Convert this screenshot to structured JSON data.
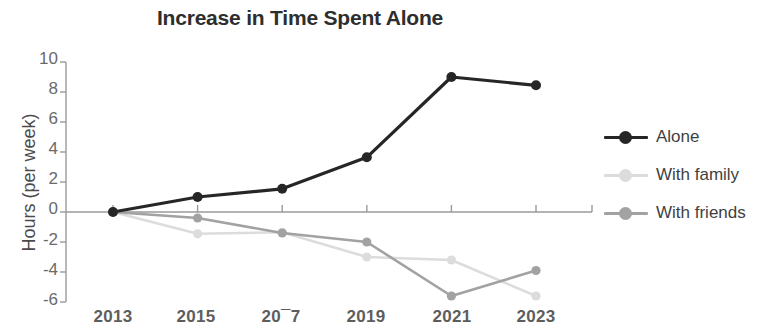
{
  "chart_data": {
    "type": "line",
    "title": "Increase in Time Spent Alone",
    "xlabel": "",
    "ylabel": "Hours (per week)",
    "categories": [
      "2013",
      "2015",
      "2017",
      "2019",
      "2021",
      "2023"
    ],
    "x_tick_labels_rendered": [
      "2013",
      "2015",
      "20¯7",
      "2019",
      "2021",
      "2023"
    ],
    "y_tick_labels": [
      "10",
      "8",
      "6",
      "4",
      "2",
      "0",
      "-2",
      "-4",
      "-6"
    ],
    "y_ticks": [
      10,
      8,
      6,
      4,
      2,
      0,
      -2,
      -4,
      -6
    ],
    "ylim": [
      -6,
      10
    ],
    "grid": false,
    "legend_position": "right",
    "series": [
      {
        "name": "Alone",
        "color": "#262626",
        "values": [
          0.0,
          1.0,
          1.55,
          3.65,
          9.0,
          8.45
        ]
      },
      {
        "name": "With family",
        "color": "#dcdcdc",
        "values": [
          0.0,
          -1.45,
          -1.35,
          -3.0,
          -3.2,
          -5.6
        ]
      },
      {
        "name": "With friends",
        "color": "#a2a2a2",
        "values": [
          0.0,
          -0.4,
          -1.4,
          -2.0,
          -5.6,
          -3.9
        ]
      }
    ]
  },
  "legend": {
    "items": [
      {
        "label": "Alone",
        "color": "#262626"
      },
      {
        "label": "With family",
        "color": "#dcdcdc"
      },
      {
        "label": "With friends",
        "color": "#a2a2a2"
      }
    ]
  },
  "axis": {
    "spine_color": "#9a9a9a",
    "zero_line_color": "#9a9a9a"
  }
}
